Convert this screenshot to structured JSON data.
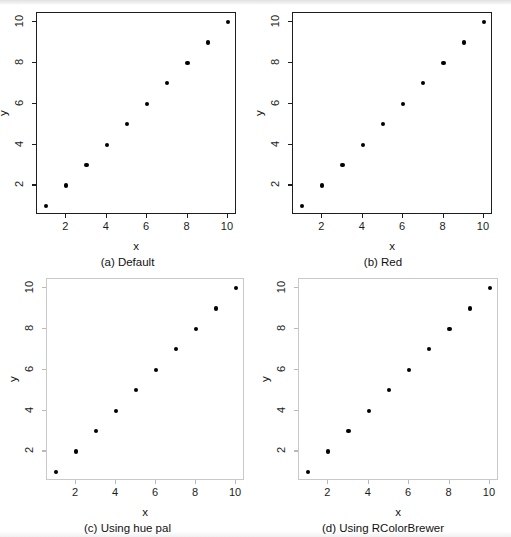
{
  "figure": {
    "layout": "2x2",
    "background_color": "#ffffff",
    "point_color": "#000000"
  },
  "panels": [
    {
      "id": "a",
      "caption": "(a) Default",
      "frame_style": "dark",
      "frame_color": "#1d1d1d",
      "chart_data": {
        "type": "scatter",
        "title": "(a) Default",
        "xlabel": "x",
        "ylabel": "y",
        "x": [
          1,
          2,
          3,
          4,
          5,
          6,
          7,
          8,
          9,
          10
        ],
        "y": [
          1,
          2,
          3,
          4,
          5,
          6,
          7,
          8,
          9,
          10
        ],
        "xlim": [
          0.55,
          10.45
        ],
        "ylim": [
          0.55,
          10.45
        ],
        "xticks": [
          2,
          4,
          6,
          8,
          10
        ],
        "yticks": [
          2,
          4,
          6,
          8,
          10
        ],
        "xticklabels": [
          "2",
          "4",
          "6",
          "8",
          "10"
        ],
        "yticklabels": [
          "2",
          "4",
          "6",
          "8",
          "10"
        ],
        "grid": false,
        "legend": false,
        "marker": "filled-circle",
        "marker_color": "#000000"
      }
    },
    {
      "id": "b",
      "caption": "(b) Red",
      "frame_style": "dark",
      "frame_color": "#1d1d1d",
      "chart_data": {
        "type": "scatter",
        "title": "(b) Red",
        "xlabel": "x",
        "ylabel": "y",
        "x": [
          1,
          2,
          3,
          4,
          5,
          6,
          7,
          8,
          9,
          10
        ],
        "y": [
          1,
          2,
          3,
          4,
          5,
          6,
          7,
          8,
          9,
          10
        ],
        "xlim": [
          0.55,
          10.45
        ],
        "ylim": [
          0.55,
          10.45
        ],
        "xticks": [
          2,
          4,
          6,
          8,
          10
        ],
        "yticks": [
          2,
          4,
          6,
          8,
          10
        ],
        "xticklabels": [
          "2",
          "4",
          "6",
          "8",
          "10"
        ],
        "yticklabels": [
          "2",
          "4",
          "6",
          "8",
          "10"
        ],
        "grid": false,
        "legend": false,
        "marker": "filled-circle",
        "marker_color": "#000000"
      }
    },
    {
      "id": "c",
      "caption": "(c) Using hue pal",
      "frame_style": "light",
      "frame_color": "#c9c9c9",
      "chart_data": {
        "type": "scatter",
        "title": "(c) Using hue pal",
        "xlabel": "x",
        "ylabel": "y",
        "x": [
          1,
          2,
          3,
          4,
          5,
          6,
          7,
          8,
          9,
          10
        ],
        "y": [
          1,
          2,
          3,
          4,
          5,
          6,
          7,
          8,
          9,
          10
        ],
        "xlim": [
          0.55,
          10.45
        ],
        "ylim": [
          0.55,
          10.45
        ],
        "xticks": [
          2,
          4,
          6,
          8,
          10
        ],
        "yticks": [
          2,
          4,
          6,
          8,
          10
        ],
        "xticklabels": [
          "2",
          "4",
          "6",
          "8",
          "10"
        ],
        "yticklabels": [
          "2",
          "4",
          "6",
          "8",
          "10"
        ],
        "grid": false,
        "legend": false,
        "marker": "filled-circle",
        "marker_color": "#000000"
      }
    },
    {
      "id": "d",
      "caption": "(d) Using RColorBrewer",
      "frame_style": "light",
      "frame_color": "#c9c9c9",
      "chart_data": {
        "type": "scatter",
        "title": "(d) Using RColorBrewer",
        "xlabel": "x",
        "ylabel": "y",
        "x": [
          1,
          2,
          3,
          4,
          5,
          6,
          7,
          8,
          9,
          10
        ],
        "y": [
          1,
          2,
          3,
          4,
          5,
          6,
          7,
          8,
          9,
          10
        ],
        "xlim": [
          0.55,
          10.45
        ],
        "ylim": [
          0.55,
          10.45
        ],
        "xticks": [
          2,
          4,
          6,
          8,
          10
        ],
        "yticks": [
          2,
          4,
          6,
          8,
          10
        ],
        "xticklabels": [
          "2",
          "4",
          "6",
          "8",
          "10"
        ],
        "yticklabels": [
          "2",
          "4",
          "6",
          "8",
          "10"
        ],
        "grid": false,
        "legend": false,
        "marker": "filled-circle",
        "marker_color": "#000000"
      }
    }
  ]
}
